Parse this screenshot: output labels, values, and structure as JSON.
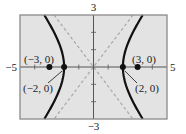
{
  "chart_data": {
    "type": "line",
    "title": "",
    "equation": "x^2/4 - y^2/5 = 1",
    "xlabel": "",
    "ylabel": "",
    "xlim": [
      -5,
      5
    ],
    "ylim": [
      -3,
      3
    ],
    "grid": false,
    "x_tick_labels": {
      "min": "−5",
      "max": "5"
    },
    "y_tick_labels": {
      "min": "−3",
      "max": "3"
    },
    "series": [
      {
        "name": "hyperbola-right-branch",
        "style": "solid",
        "a": 2,
        "b": 2.236,
        "branch": "right"
      },
      {
        "name": "hyperbola-left-branch",
        "style": "solid",
        "a": 2,
        "b": 2.236,
        "branch": "left"
      },
      {
        "name": "asymptote-positive",
        "style": "dashed",
        "slope": 1.118
      },
      {
        "name": "asymptote-negative",
        "style": "dashed",
        "slope": -1.118
      }
    ],
    "points": [
      {
        "x": -3,
        "y": 0,
        "label": "(−3, 0)",
        "role": "focus"
      },
      {
        "x": -2,
        "y": 0,
        "label": "(−2, 0)",
        "role": "vertex"
      },
      {
        "x": 2,
        "y": 0,
        "label": "(2, 0)",
        "role": "vertex"
      },
      {
        "x": 3,
        "y": 0,
        "label": "(3, 0)",
        "role": "focus"
      }
    ],
    "colors": {
      "plot_background": "#e3e3e3",
      "frame": "#8a8a8a",
      "axes": "#555555",
      "curve": "#111111",
      "asymptote": "#a8a8a8",
      "point": "#111111"
    }
  }
}
